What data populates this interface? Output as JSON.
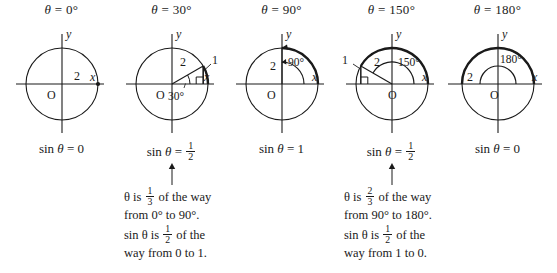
{
  "figure": {
    "type": "math-illustration",
    "topic": "Sine values on a circle of radius 2 for selected angles",
    "background": "#ffffff",
    "ink": "#1a1a1a"
  },
  "panels": [
    {
      "id": "theta-0",
      "title_symbol": "θ",
      "title_equals": "=",
      "title_value": "0°",
      "angle_deg": 0,
      "radius_label": "2",
      "origin_label": "O",
      "x_axis_label": "x",
      "y_axis_label": "y",
      "angle_arc_label": null,
      "hypotenuse_label": null,
      "opposite_label": null,
      "show_right_angle": false,
      "show_terminal_point": true,
      "sin_prefix": "sin",
      "sin_symbol": "θ",
      "sin_equals": "=",
      "sin_value": "0",
      "sin_is_fraction": false,
      "sin_num": null,
      "sin_den": null
    },
    {
      "id": "theta-30",
      "title_symbol": "θ",
      "title_equals": "=",
      "title_value": "30°",
      "angle_deg": 30,
      "radius_label": "2",
      "origin_label": "O",
      "x_axis_label": "x",
      "y_axis_label": "y",
      "angle_arc_label": "30°",
      "hypotenuse_label": "2",
      "opposite_label": "1",
      "show_right_angle": true,
      "show_terminal_point": false,
      "sin_prefix": "sin",
      "sin_symbol": "θ",
      "sin_equals": "=",
      "sin_value": "1/2",
      "sin_is_fraction": true,
      "sin_num": "1",
      "sin_den": "2"
    },
    {
      "id": "theta-90",
      "title_symbol": "θ",
      "title_equals": "=",
      "title_value": "90°",
      "angle_deg": 90,
      "radius_label": "2",
      "origin_label": "O",
      "x_axis_label": "x",
      "y_axis_label": "y",
      "angle_arc_label": "90°",
      "hypotenuse_label": "2",
      "opposite_label": null,
      "show_right_angle": false,
      "show_terminal_point": false,
      "sin_prefix": "sin",
      "sin_symbol": "θ",
      "sin_equals": "=",
      "sin_value": "1",
      "sin_is_fraction": false,
      "sin_num": null,
      "sin_den": null
    },
    {
      "id": "theta-150",
      "title_symbol": "θ",
      "title_equals": "=",
      "title_value": "150°",
      "angle_deg": 150,
      "radius_label": "2",
      "origin_label": "O",
      "x_axis_label": "x",
      "y_axis_label": "y",
      "angle_arc_label": "150°",
      "hypotenuse_label": "2",
      "opposite_label": "1",
      "show_right_angle": true,
      "show_terminal_point": false,
      "sin_prefix": "sin",
      "sin_symbol": "θ",
      "sin_equals": "=",
      "sin_value": "1/2",
      "sin_is_fraction": true,
      "sin_num": "1",
      "sin_den": "2"
    },
    {
      "id": "theta-180",
      "title_symbol": "θ",
      "title_equals": "=",
      "title_value": "180°",
      "angle_deg": 180,
      "radius_label": "2",
      "origin_label": "O",
      "x_axis_label": "x",
      "y_axis_label": "y",
      "angle_arc_label": "180°",
      "hypotenuse_label": "2",
      "opposite_label": null,
      "show_right_angle": false,
      "show_terminal_point": false,
      "sin_prefix": "sin",
      "sin_symbol": "θ",
      "sin_equals": "=",
      "sin_value": "0",
      "sin_is_fraction": false,
      "sin_num": null,
      "sin_den": null
    }
  ],
  "notes": [
    {
      "id": "note-left",
      "points_to": "theta-30",
      "line1_a": "θ is",
      "line1_frac_n": "1",
      "line1_frac_d": "3",
      "line1_b": "of the way",
      "line2": "from 0° to 90°.",
      "line3_a": "sin θ is",
      "line3_frac_n": "1",
      "line3_frac_d": "2",
      "line3_b": "of the",
      "line4": "way from 0 to 1."
    },
    {
      "id": "note-right",
      "points_to": "theta-150",
      "line1_a": "θ is",
      "line1_frac_n": "2",
      "line1_frac_d": "3",
      "line1_b": "of the way",
      "line2": "from 90° to 180°.",
      "line3_a": "sin θ is",
      "line3_frac_n": "1",
      "line3_frac_d": "2",
      "line3_b": "of the",
      "line4": "way from 1 to 0."
    }
  ]
}
